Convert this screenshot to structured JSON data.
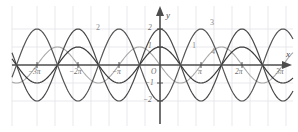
{
  "figure": {
    "kind": "coordinate-plane-trigonometric-graph",
    "background": "#ffffff",
    "grid_color": "#e2e2ea",
    "axis_color": "#4d4d4d",
    "width": 298,
    "height": 132
  },
  "axes": {
    "x_axis_label": "x",
    "y_axis_label": "y",
    "origin_label": "O",
    "x_ticks": [
      {
        "label": "−3π",
        "value": -9.4248
      },
      {
        "label": "−2π",
        "value": -6.2832
      },
      {
        "label": "−π",
        "value": -3.1416
      },
      {
        "label": "π",
        "value": 3.1416
      },
      {
        "label": "2π",
        "value": 6.2832
      },
      {
        "label": "3π",
        "value": 9.4248
      }
    ],
    "y_ticks": [
      {
        "label": "2",
        "value": 2
      },
      {
        "label": "1",
        "value": 1
      },
      {
        "label": "−1",
        "value": -1
      },
      {
        "label": "−2",
        "value": -2
      }
    ],
    "xlim": [
      -10.7,
      10.7
    ],
    "ylim": [
      -2.6,
      2.6
    ]
  },
  "chart_data": {
    "type": "line",
    "title": "",
    "xlabel": "x",
    "ylabel": "y",
    "xlim": [
      -10.7,
      10.7
    ],
    "ylim": [
      -2.6,
      2.6
    ],
    "grid": true,
    "legend": "inline-curve-numbers",
    "x_tick_labels": [
      "−3π",
      "−2π",
      "−π",
      "π",
      "2π",
      "3π"
    ],
    "y_tick_labels": [
      "2",
      "1",
      "−1",
      "−2"
    ],
    "series": [
      {
        "name": "1",
        "label": "1",
        "color": "#3a3a3a",
        "amplitude": 1,
        "period": 6.2832,
        "phase": 0,
        "vertical_shift": 0,
        "form": "y = cos(x)",
        "label_position": {
          "x": 192,
          "y": 42
        }
      },
      {
        "name": "2",
        "label": "2",
        "color": "#555555",
        "amplitude": 2,
        "period": 6.2832,
        "phase": 3.1416,
        "vertical_shift": 0,
        "form": "y = -2 cos(x)",
        "label_position": {
          "x": 96,
          "y": 24
        }
      },
      {
        "name": "3",
        "label": "3",
        "color": "#4a4a4a",
        "amplitude": 2,
        "period": 6.2832,
        "phase": 0,
        "vertical_shift": 0,
        "form": "y = 2 cos(x)",
        "label_position": {
          "x": 210,
          "y": 19
        }
      },
      {
        "name": "4",
        "label": "4",
        "color": "#a8a8a8",
        "amplitude": 1,
        "period": 6.2832,
        "phase": 1.5708,
        "vertical_shift": 0,
        "form": "y = sin(x)",
        "label_position": {
          "x": 211,
          "y": 48
        }
      }
    ]
  },
  "colors": {
    "grid": "#e3e3ea",
    "axis": "#4d4d4d",
    "curve_dark": "#3a3a3a",
    "curve_mid": "#555555",
    "curve_light": "#a8a8a8",
    "text": "#6b6b6b"
  }
}
